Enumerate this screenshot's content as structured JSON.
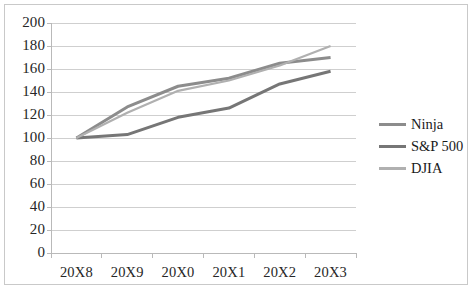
{
  "chart_data": {
    "type": "line",
    "title": "",
    "subtitle": "",
    "xlabel": "",
    "ylabel": "",
    "categories": [
      "20X8",
      "20X9",
      "20X0",
      "20X1",
      "20X2",
      "20X3"
    ],
    "series": [
      {
        "name": "Ninja",
        "values": [
          100,
          127,
          145,
          152,
          165,
          170
        ],
        "color": "#8c8c8c",
        "width": 3.0
      },
      {
        "name": "S&P 500",
        "values": [
          100,
          103,
          118,
          126,
          147,
          158
        ],
        "color": "#767676",
        "width": 3.0
      },
      {
        "name": "DJIA",
        "values": [
          100,
          122,
          141,
          150,
          163,
          180
        ],
        "color": "#b0b0b0",
        "width": 2.2
      }
    ],
    "ylim": [
      0,
      200
    ],
    "ytick_step": 20,
    "ytick_labels": [
      "0",
      "20",
      "40",
      "60",
      "80",
      "100",
      "120",
      "140",
      "160",
      "180",
      "200"
    ],
    "grid": {
      "horizontal": true,
      "vertical": false
    },
    "legend": {
      "position": "right",
      "entries": [
        "Ninja",
        "S&P 500",
        "DJIA"
      ]
    },
    "frame_border_color": "#c9c9c9",
    "gridline_color": "#cfcfcf",
    "axis_color": "#b9b9b9",
    "plot_background": "#ffffff"
  }
}
